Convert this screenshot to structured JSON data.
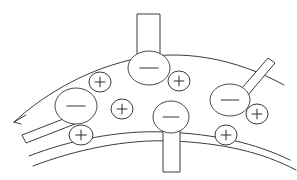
{
  "figure": {
    "width": 297,
    "height": 180,
    "background_color": "#ffffff",
    "stroke_color": "#3c3c3c",
    "ion_stroke_color": "#4a4a4a"
  },
  "membrane": {
    "label": "membrane",
    "upper_boundary": {
      "name": "upper-boundary-curve",
      "path": "M 14 122 C 40 98, 80 72, 130 60 C 180 48, 235 58, 284 85",
      "has_end_arrow": true,
      "arrow_path": "M 14 122 L 26 115 M 14 122 L 21 124"
    },
    "lower_boundary": {
      "name": "lower-boundary-curve",
      "path": "M 29 156 C 70 140, 120 130, 165 132 C 215 134, 255 143, 290 160"
    },
    "outer_lower_boundary": {
      "name": "outer-lower-curve",
      "path": "M 33 166 C 75 150, 125 139, 172 141 C 222 143, 262 152, 296 170"
    }
  },
  "channels": [
    {
      "name": "channel-top-center",
      "orientation": "vertical-up",
      "polygon": "137,14 160,14 160,56 137,56",
      "description": "vertical transmembrane stem at top center"
    },
    {
      "name": "channel-bottom-center",
      "orientation": "vertical-down",
      "polygon": "163,121 180,121 180,172 163,172",
      "description": "vertical transmembrane stem at bottom center"
    },
    {
      "name": "channel-left-diagonal",
      "orientation": "diagonal-lower-left",
      "polygon": "22,135 71,116 75,124 26,143",
      "description": "diagonal stem exiting lower left"
    },
    {
      "name": "channel-right-diagonal",
      "orientation": "diagonal-upper-right",
      "polygon": "236,95 268,58 275,63 243,101",
      "description": "diagonal stem exiting upper right"
    }
  ],
  "ions": [
    {
      "name": "ion-negative-top-center",
      "charge": "-",
      "symbol": "−",
      "cx": 149,
      "cy": 68,
      "rx": 21,
      "ry": 17
    },
    {
      "name": "ion-negative-left",
      "charge": "-",
      "symbol": "−",
      "cx": 76,
      "cy": 106,
      "rx": 21,
      "ry": 18
    },
    {
      "name": "ion-negative-bottom-center",
      "charge": "-",
      "symbol": "−",
      "cx": 171,
      "cy": 117,
      "rx": 18,
      "ry": 16
    },
    {
      "name": "ion-negative-right",
      "charge": "-",
      "symbol": "−",
      "cx": 230,
      "cy": 100,
      "rx": 20,
      "ry": 16
    },
    {
      "name": "ion-positive-upper-left",
      "charge": "+",
      "symbol": "+",
      "cx": 100,
      "cy": 82,
      "rx": 11,
      "ry": 10
    },
    {
      "name": "ion-positive-upper-right",
      "charge": "+",
      "symbol": "+",
      "cx": 179,
      "cy": 81,
      "rx": 11,
      "ry": 10
    },
    {
      "name": "ion-positive-center",
      "charge": "+",
      "symbol": "+",
      "cx": 122,
      "cy": 109,
      "rx": 11,
      "ry": 10
    },
    {
      "name": "ion-positive-lower-left",
      "charge": "+",
      "symbol": "+",
      "cx": 81,
      "cy": 135,
      "rx": 12,
      "ry": 10
    },
    {
      "name": "ion-positive-lower-right",
      "charge": "+",
      "symbol": "+",
      "cx": 226,
      "cy": 135,
      "rx": 11,
      "ry": 10
    },
    {
      "name": "ion-positive-far-right",
      "charge": "+",
      "symbol": "+",
      "cx": 257,
      "cy": 114,
      "rx": 11,
      "ry": 10
    }
  ]
}
